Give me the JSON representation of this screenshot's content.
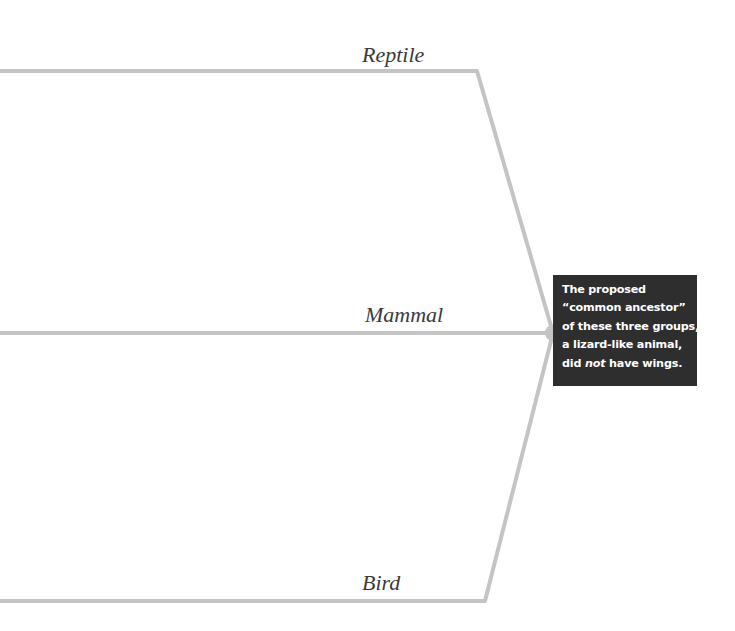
{
  "diagram": {
    "type": "cladogram",
    "colors": {
      "branch": "#c4c4c4",
      "node": "#c4c4c4",
      "note_background": "#2e2e2e",
      "note_text": "#ffffff",
      "label_text": "#3a3a3a"
    },
    "branches": [
      {
        "id": "reptile",
        "label": "Reptile"
      },
      {
        "id": "mammal",
        "label": "Mammal"
      },
      {
        "id": "bird",
        "label": "Bird"
      }
    ],
    "ancestor_note": {
      "line1": "The proposed",
      "line2": "“common ancestor”",
      "line3": "of these three groups,",
      "line4": "a lizard-like animal,",
      "line5_pre": "did ",
      "line5_em": "not",
      "line5_post": " have wings."
    }
  }
}
